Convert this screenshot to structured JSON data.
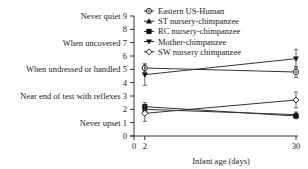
{
  "chart_data": {
    "type": "line",
    "title": "",
    "xlabel": "Infant age (days)",
    "ylabel": "",
    "x": [
      2,
      30
    ],
    "xticks": [
      0,
      2,
      30
    ],
    "xlim": [
      0,
      30
    ],
    "ylim": [
      0,
      9
    ],
    "yticks": [
      {
        "value": 9,
        "label": "Never quiet 9"
      },
      {
        "value": 8,
        "label": "8"
      },
      {
        "value": 7,
        "label": "When uncovered 7"
      },
      {
        "value": 6,
        "label": "6"
      },
      {
        "value": 5,
        "label": "When undressed or handled 5"
      },
      {
        "value": 4,
        "label": "4"
      },
      {
        "value": 3,
        "label": "Near end of test with reflexes 3"
      },
      {
        "value": 2,
        "label": "2"
      },
      {
        "value": 1,
        "label": "Never upset 1"
      },
      {
        "value": 0,
        "label": "0"
      }
    ],
    "grid": false,
    "legend_position": "upper right",
    "series": [
      {
        "name": "Eastern US-Human",
        "marker": "circle-dot",
        "values": [
          5.1,
          4.8
        ],
        "errors": [
          0.3,
          0.4
        ]
      },
      {
        "name": "ST nursery-chimpanzee",
        "marker": "triangle",
        "values": [
          2.0,
          1.6
        ],
        "errors": [
          0.3,
          0.2
        ]
      },
      {
        "name": "RC nursery-chimpanzee",
        "marker": "square",
        "values": [
          2.2,
          1.5
        ],
        "errors": [
          0.3,
          0.2
        ]
      },
      {
        "name": "Mother-chimpanzee",
        "marker": "triangle-down",
        "values": [
          4.6,
          5.8
        ],
        "errors": [
          0.8,
          0.7
        ]
      },
      {
        "name": "SW nursery chimpanzee",
        "marker": "diamond-open",
        "values": [
          1.7,
          2.7
        ],
        "errors": [
          0.6,
          0.6
        ]
      }
    ]
  }
}
